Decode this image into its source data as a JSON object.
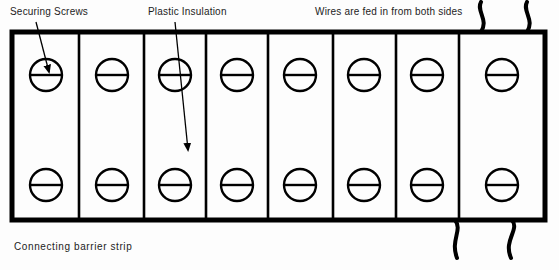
{
  "figure": {
    "caption": "Connecting barrier strip",
    "background_color": "#fdfdfd",
    "ink_color": "#000000"
  },
  "annotations": {
    "securing_screws": {
      "label": "Securing Screws",
      "arrow_from": [
        36,
        22
      ],
      "arrow_to": [
        49,
        72
      ]
    },
    "plastic_insulation": {
      "label": "Plastic Insulation",
      "arrow_from": [
        175,
        22
      ],
      "arrow_to": [
        188,
        150
      ]
    },
    "wires": {
      "label": "Wires are fed in from both sides"
    }
  },
  "barrier_strip": {
    "body": {
      "x": 12,
      "y": 32,
      "width": 533,
      "height": 188
    },
    "cell_count": 8,
    "divider_x": [
      79,
      144,
      206,
      268,
      333,
      396,
      459
    ],
    "screw_rows": 2,
    "screw_row_y": [
      75,
      185
    ],
    "screw_radius": 16,
    "screw_center_x": [
      46,
      112,
      175,
      237,
      300,
      364,
      427,
      502
    ],
    "screw_icon": "slotted-screw-head"
  },
  "wires": {
    "top": [
      {
        "x": 481,
        "y_start": 2,
        "y_end": 32
      },
      {
        "x": 527,
        "y_start": 2,
        "y_end": 32
      }
    ],
    "bottom": [
      {
        "x": 455,
        "y_start": 220,
        "y_end": 258
      },
      {
        "x": 512,
        "y_start": 220,
        "y_end": 258
      }
    ]
  }
}
